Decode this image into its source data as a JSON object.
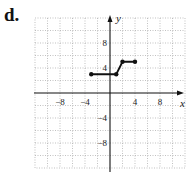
{
  "figure_label": "d.",
  "chart_data": {
    "type": "line",
    "title": "",
    "xlabel": "x",
    "ylabel": "y",
    "xlim": [
      -12,
      12
    ],
    "ylim": [
      -12,
      12
    ],
    "grid": true,
    "grid_step": 2,
    "x_tick_labels": [
      "-8",
      "-4",
      "4",
      "8"
    ],
    "y_tick_labels": [
      "8",
      "4",
      "-4",
      "-8"
    ],
    "series": [
      {
        "name": "piecewise",
        "points": [
          [
            -3,
            3
          ],
          [
            1,
            3
          ],
          [
            2,
            5
          ],
          [
            4,
            5
          ]
        ],
        "endpoints": "closed"
      }
    ]
  }
}
